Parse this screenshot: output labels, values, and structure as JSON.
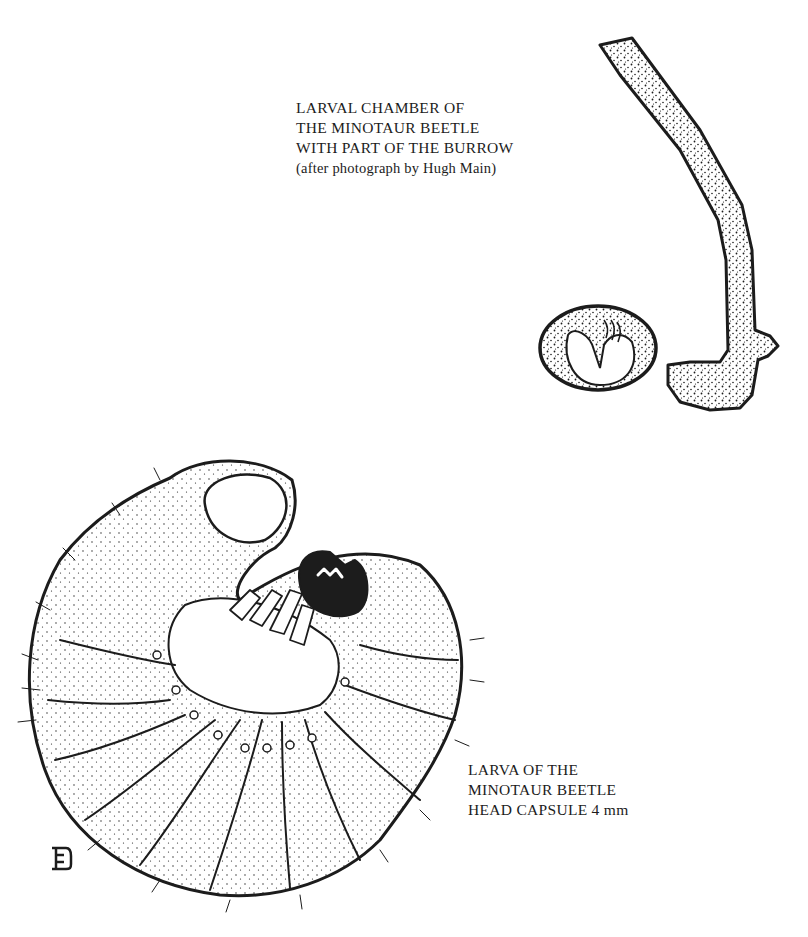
{
  "figure": {
    "chamber_caption": {
      "lines": [
        "LARVAL CHAMBER OF",
        "THE MINOTAUR BEETLE",
        "WITH PART OF THE BURROW",
        "(after photograph by Hugh Main)"
      ]
    },
    "larva_caption": {
      "lines": [
        "LARVA OF THE",
        "MINOTAUR BEETLE",
        "HEAD CAPSULE 4 mm"
      ]
    },
    "artist_monogram": "E"
  },
  "colors": {
    "ink": "#1c1c1c",
    "paper": "#ffffff"
  }
}
